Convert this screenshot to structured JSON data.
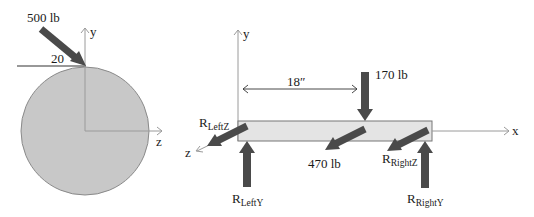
{
  "figure": {
    "cross_section": {
      "axis_y_label": "y",
      "axis_z_label": "z",
      "force_label": "500 lb",
      "angle_label": "20",
      "colors": {
        "disk_fill": "#c8c8c8",
        "disk_stroke": "#8a8a8a",
        "arrow": "#4a4a4a",
        "axis": "#9a9a9a"
      }
    },
    "beam_view": {
      "axis_y_label": "y",
      "axis_x_label": "x",
      "axis_z_label": "z",
      "dimension_label": "18″",
      "load_vertical_label": "170 lb",
      "load_z_label": "470 lb",
      "reactions": {
        "left_z": {
          "main": "R",
          "sub": "LeftZ"
        },
        "left_y": {
          "main": "R",
          "sub": "LeftY"
        },
        "right_z": {
          "main": "R",
          "sub": "RightZ"
        },
        "right_y": {
          "main": "R",
          "sub": "RightY"
        }
      },
      "colors": {
        "beam_fill": "#e4e4e4",
        "beam_stroke": "#777777",
        "arrow": "#4a4a4a",
        "axis": "#9a9a9a"
      }
    }
  }
}
